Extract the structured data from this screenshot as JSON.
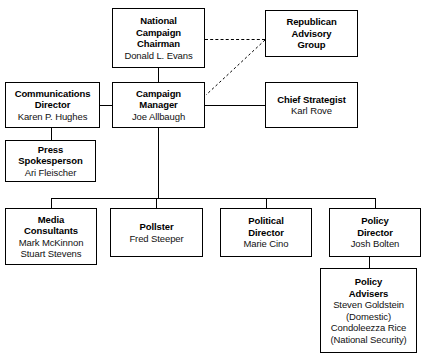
{
  "chart": {
    "type": "org-chart",
    "nodes": [
      {
        "id": "national-campaign-chairman",
        "title_lines": [
          "National",
          "Campaign",
          "Chairman"
        ],
        "person_lines": [
          "Donald L. Evans"
        ],
        "title": "National Campaign Chairman",
        "person": "Donald L. Evans"
      },
      {
        "id": "republican-advisory-group",
        "title_lines": [
          "Republican",
          "Advisory",
          "Group"
        ],
        "person_lines": [],
        "title": "Republican Advisory Group",
        "person": ""
      },
      {
        "id": "communications-director",
        "title_lines": [
          "Communications",
          "Director"
        ],
        "person_lines": [
          "Karen P. Hughes"
        ],
        "title": "Communications Director",
        "person": "Karen P. Hughes"
      },
      {
        "id": "campaign-manager",
        "title_lines": [
          "Campaign",
          "Manager"
        ],
        "person_lines": [
          "Joe Allbaugh"
        ],
        "title": "Campaign Manager",
        "person": "Joe Allbaugh"
      },
      {
        "id": "chief-strategist",
        "title_lines": [
          "Chief Strategist"
        ],
        "person_lines": [
          "Karl Rove"
        ],
        "title": "Chief Strategist",
        "person": "Karl Rove"
      },
      {
        "id": "press-spokesperson",
        "title_lines": [
          "Press",
          "Spokesperson"
        ],
        "person_lines": [
          "Ari Fleischer"
        ],
        "title": "Press Spokesperson",
        "person": "Ari Fleischer"
      },
      {
        "id": "media-consultants",
        "title_lines": [
          "Media",
          "Consultants"
        ],
        "person_lines": [
          "Mark McKinnon",
          "Stuart Stevens"
        ],
        "title": "Media Consultants",
        "person": "Mark McKinnon, Stuart Stevens"
      },
      {
        "id": "pollster",
        "title_lines": [
          "Pollster"
        ],
        "person_lines": [
          "Fred Steeper"
        ],
        "title": "Pollster",
        "person": "Fred Steeper"
      },
      {
        "id": "political-director",
        "title_lines": [
          "Political",
          "Director"
        ],
        "person_lines": [
          "Marie Cino"
        ],
        "title": "Political Director",
        "person": "Marie Cino"
      },
      {
        "id": "policy-director",
        "title_lines": [
          "Policy",
          "Director"
        ],
        "person_lines": [
          "Josh Bolten"
        ],
        "title": "Policy Director",
        "person": "Josh Bolten"
      },
      {
        "id": "policy-advisers",
        "title_lines": [
          "Policy",
          "Advisers"
        ],
        "person_lines": [
          "Steven Goldstein",
          "(Domestic)",
          "Condoleezza Rice",
          "(National Security)"
        ],
        "title": "Policy Advisers",
        "person": "Steven Goldstein (Domestic), Condoleezza Rice (National Security)"
      }
    ],
    "colors": {
      "box_border": "#000000",
      "box_fill": "#ffffff",
      "line": "#000000",
      "title_text": "#000000",
      "person_text": "#111111",
      "background": "#ffffff"
    },
    "line_styles": {
      "solid": "solid",
      "dashed": "dashed"
    }
  }
}
